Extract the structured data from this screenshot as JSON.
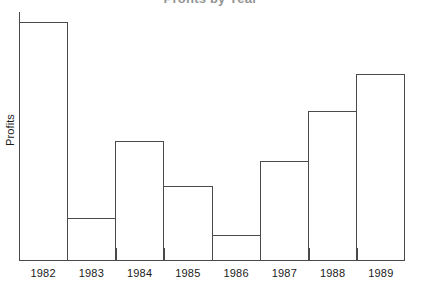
{
  "chart_data": {
    "type": "bar",
    "title": "Profits by Year",
    "title_clipped": true,
    "xlabel": "",
    "ylabel": "Profits",
    "categories": [
      "1982",
      "1983",
      "1984",
      "1985",
      "1986",
      "1987",
      "1988",
      "1989"
    ],
    "values": [
      96,
      17,
      48,
      30,
      10,
      40,
      60,
      75
    ],
    "series": [
      {
        "name": "Profits",
        "values": [
          96,
          17,
          48,
          30,
          10,
          40,
          60,
          75
        ]
      }
    ],
    "ylim": [
      0,
      100
    ],
    "y_tick_labels": [],
    "grid": false,
    "legend": null,
    "bar_fill_color": "#ffffff",
    "bar_outline_color": "#4a4a4a",
    "axis_color": "#4a4a4a",
    "background_color": "#ffffff",
    "text_color": "#1a1a1a",
    "bar_gap": 0,
    "annotations": []
  },
  "axes": {
    "y_title": "Profits"
  }
}
